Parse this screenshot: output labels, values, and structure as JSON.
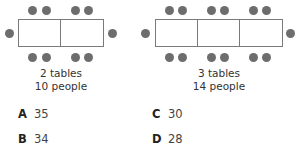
{
  "figures": [
    {
      "tables": 2,
      "caption_line1": "2 tables",
      "caption_line2": "10 people"
    },
    {
      "tables": 3,
      "caption_line1": "3 tables",
      "caption_line2": "14 people"
    }
  ],
  "answers": [
    {
      "letter": "A",
      "value": "35"
    },
    {
      "letter": "B",
      "value": "34"
    },
    {
      "letter": "C",
      "value": "30"
    },
    {
      "letter": "D",
      "value": "28"
    }
  ],
  "colors": {
    "dot": "#6d6d6d",
    "table_border": "#7a7a7a"
  }
}
